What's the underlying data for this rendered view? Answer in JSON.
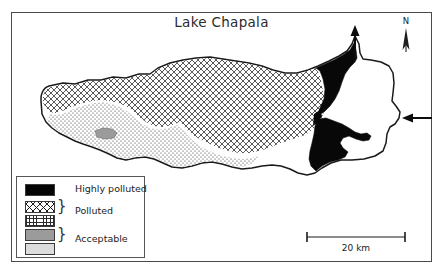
{
  "figure": {
    "title": "Lake Chapala",
    "frame": {
      "border_color": "#4a4a4a"
    }
  },
  "compass": {
    "label": "N",
    "icon": "north-arrow-icon"
  },
  "legend": {
    "items": [
      {
        "label": "Highly polluted",
        "swatches": [
          "solid-black"
        ],
        "color": "#050505"
      },
      {
        "label": "Polluted",
        "swatches": [
          "cross-hatch",
          "fine-dots"
        ],
        "color": "#1d1d1d"
      },
      {
        "label": "Acceptable",
        "swatches": [
          "medium-gray",
          "light-gray"
        ],
        "color": "#9b9b9b"
      }
    ]
  },
  "scale_bar": {
    "label": "20 km",
    "length_km": 20
  },
  "flow_arrows": [
    {
      "name": "outflow-arrow",
      "direction": "north",
      "description": "outflow at north-east corner"
    },
    {
      "name": "inflow-arrow",
      "direction": "west",
      "description": "inflow on east shore"
    }
  ],
  "lake": {
    "name": "Lake Chapala",
    "zones": [
      {
        "name": "highly-polluted-zone",
        "pattern": "solid-black",
        "position": "eastern end"
      },
      {
        "name": "polluted-crosshatch-zone",
        "pattern": "cross-hatch",
        "position": "northern and central body"
      },
      {
        "name": "polluted-dotted-zone",
        "pattern": "fine-dots",
        "position": "south-western shore"
      },
      {
        "name": "acceptable-gray-patch",
        "pattern": "medium-gray",
        "position": "south-west small patch"
      }
    ]
  }
}
